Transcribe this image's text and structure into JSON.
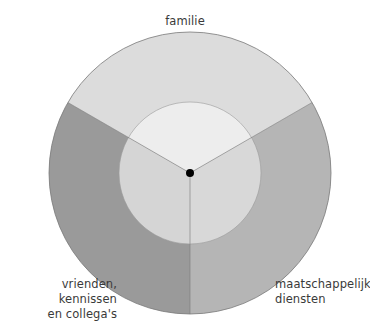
{
  "diagram": {
    "type": "concentric-sector-diagram",
    "center": {
      "x": 190,
      "y": 173
    },
    "outer_radius": 141,
    "inner_radius": 71,
    "center_dot_radius": 4,
    "sectors": [
      {
        "id": "familie",
        "label_lines": [
          "familie"
        ],
        "outer_color": "#dcdcdc",
        "inner_color": "#ededed",
        "start_angle_deg": -150,
        "end_angle_deg": -30
      },
      {
        "id": "maatschappelijke-diensten",
        "label_lines": [
          "maatschappelijke",
          "diensten"
        ],
        "outer_color": "#b5b5b5",
        "inner_color": "#d8d8d8",
        "start_angle_deg": -30,
        "end_angle_deg": 90
      },
      {
        "id": "vrienden-kennissen-collegas",
        "label_lines": [
          "vrienden, kennissen",
          "en collega's"
        ],
        "outer_color": "#9a9a9a",
        "inner_color": "#d5d5d5",
        "start_angle_deg": 90,
        "end_angle_deg": 210
      }
    ],
    "stroke_color": "#7a7a7a",
    "dot_color": "#000000"
  },
  "labels": {
    "top": "familie",
    "left_line1": "vrienden, kennissen",
    "left_line2": "en collega's",
    "right_line1": "maatschappelijke",
    "right_line2": "diensten"
  }
}
